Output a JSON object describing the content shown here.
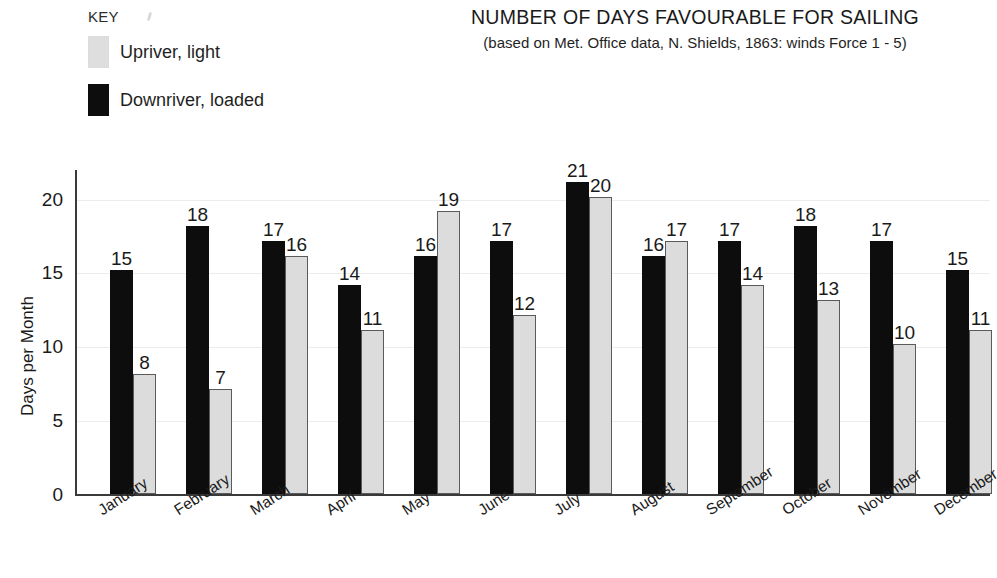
{
  "legend": {
    "key_label": "KEY",
    "items": [
      {
        "label": "Upriver, light",
        "color": "#dcdcdc",
        "swatch": "light"
      },
      {
        "label": "Downriver, loaded",
        "color": "#0d0d0d",
        "swatch": "dark"
      }
    ]
  },
  "chart_data": {
    "type": "bar",
    "title": "NUMBER OF DAYS FAVOURABLE FOR SAILING",
    "subtitle": "(based on Met. Office data, N. Shields, 1863: winds Force 1 - 5)",
    "xlabel": "",
    "ylabel": "Days per Month",
    "ylim": [
      0,
      22
    ],
    "yticks": [
      0,
      5,
      10,
      15,
      20
    ],
    "ytick_labels": [
      "0",
      "5",
      "10",
      "15",
      "20"
    ],
    "grid": true,
    "legend_position": "top-left",
    "categories": [
      "January",
      "February",
      "March",
      "April",
      "May",
      "June",
      "July",
      "August",
      "September",
      "October",
      "November",
      "December"
    ],
    "series": [
      {
        "name": "Downriver, loaded",
        "color": "#0d0d0d",
        "values": [
          15,
          18,
          17,
          14,
          16,
          17,
          21,
          16,
          17,
          18,
          17,
          15
        ]
      },
      {
        "name": "Upriver, light",
        "color": "#dcdcdc",
        "values": [
          8,
          7,
          16,
          11,
          19,
          12,
          20,
          17,
          14,
          13,
          10,
          11
        ]
      }
    ]
  }
}
